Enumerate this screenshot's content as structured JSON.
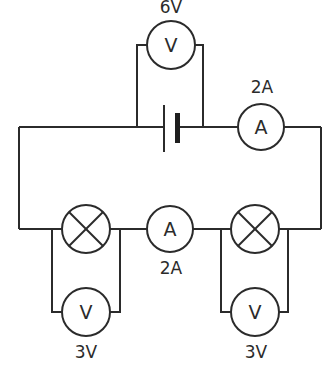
{
  "diagram": {
    "title": "",
    "type": "series circuit",
    "stroke_color": "#2b2b2b",
    "background": "#ffffff",
    "components": {
      "battery": {
        "kind": "cell"
      },
      "voltmeter_supply": {
        "symbol": "V",
        "reading": "6V"
      },
      "ammeter_main": {
        "symbol": "A",
        "reading": "2A"
      },
      "lamp_left": {
        "kind": "lamp"
      },
      "ammeter_middle": {
        "symbol": "A",
        "reading": "2A"
      },
      "lamp_right": {
        "kind": "lamp"
      },
      "voltmeter_left": {
        "symbol": "V",
        "reading": "3V"
      },
      "voltmeter_right": {
        "symbol": "V",
        "reading": "3V"
      }
    }
  }
}
